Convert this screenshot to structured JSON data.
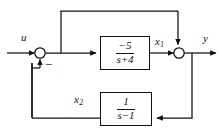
{
  "diagram": {
    "type": "control-system-block-diagram",
    "stroke_color": "#111111",
    "background_color": "#ffffff",
    "signals": {
      "input_label": "u",
      "output_label": "y",
      "state1_label": "x",
      "state1_subscript": "1",
      "state2_label": "x",
      "state2_subscript": "2"
    },
    "summing_junctions": [
      {
        "name": "input-summer",
        "sign_label": "−",
        "inputs": [
          "u",
          "x2-feedback"
        ],
        "output": "forward-path"
      },
      {
        "name": "output-summer",
        "sign_label": "",
        "inputs": [
          "x1",
          "top-feedforward"
        ],
        "output": "y"
      }
    ],
    "blocks": [
      {
        "name": "forward-transfer-block",
        "numerator": "−5",
        "denominator": "s+4",
        "transfer_function": "-5/(s+4)"
      },
      {
        "name": "feedback-transfer-block",
        "numerator": "1",
        "denominator": "s−1",
        "transfer_function": "1/(s-1)"
      }
    ]
  }
}
